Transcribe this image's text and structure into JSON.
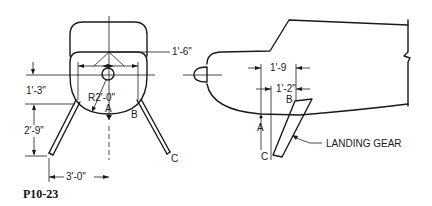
{
  "figure_id": "P10-23",
  "front_view": {
    "dimensions": {
      "top_width": "1'-6\"",
      "hub_offset": "1'-3\"",
      "radius": "R2'-0\"",
      "leg_height": "2'-9\"",
      "leg_spread": "3'-0\""
    },
    "points": {
      "a": "A",
      "b": "B",
      "c": "C"
    }
  },
  "side_view": {
    "dimensions": {
      "upper": "1'-9",
      "lower": "1'-2\""
    },
    "points": {
      "a": "A",
      "b": "B",
      "c": "C"
    },
    "callout": "LANDING GEAR"
  },
  "colors": {
    "ink": "#1a1a1a",
    "background": "#ffffff"
  }
}
